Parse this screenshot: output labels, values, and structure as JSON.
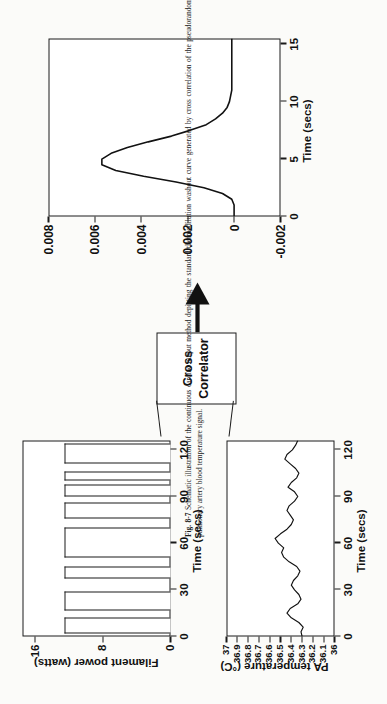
{
  "figure": {
    "label": "Fig. 8-7",
    "caption": "Schematic illustration of the continuous cardiac output method depicting the standard thermodilution washout curve generated by cross correlation of the pseudorandom filament power input sequence with the resulting pulmonary artery blood temperature signal.",
    "rotation_note": "page rotated 90 degrees"
  },
  "washout_plot": {
    "name": "thermodilution-washout-curve",
    "xlabel": "Time (secs)",
    "ylabel": "",
    "xticks": [
      "0",
      "5",
      "10",
      "15"
    ],
    "yticks": [
      "-0.002",
      "0",
      "0.002",
      "0.004",
      "0.006",
      "0.008"
    ]
  },
  "correlator": {
    "line1": "Cross",
    "line2": "Correlator"
  },
  "filament_plot": {
    "name": "filament-power-chart",
    "ylabel": "Filament power (watts)",
    "xlabel": "Time (secs)",
    "xticks": [
      "0",
      "30",
      "60",
      "90",
      "120"
    ],
    "yticks": [
      "0",
      "8",
      "16"
    ]
  },
  "temperature_plot": {
    "name": "pa-temperature-chart",
    "ylabel": "PA temperature (°C)",
    "xlabel": "Time (secs)",
    "xticks": [
      "0",
      "30",
      "60",
      "90",
      "120"
    ],
    "yticks": [
      "36",
      "36.1",
      "36.2",
      "36.3",
      "36.4",
      "36.5",
      "36.6",
      "36.7",
      "36.8",
      "36.9",
      "37"
    ]
  },
  "chart_data": [
    {
      "type": "bar",
      "title": "Filament power (watts) vs Time (secs)",
      "xlabel": "Time (secs)",
      "ylabel": "Filament power (watts)",
      "xlim": [
        0,
        126
      ],
      "ylim": [
        0,
        17.5
      ],
      "xticks": [
        0,
        30,
        60,
        90,
        120
      ],
      "yticks": [
        0,
        8,
        16
      ],
      "grid": false,
      "description": "Pseudorandom binary on/off filament power sequence alternating between 0 and ~12.5 watts",
      "bars": [
        {
          "start": 2,
          "end": 12,
          "value": 12.5
        },
        {
          "start": 17,
          "end": 29,
          "value": 12.5
        },
        {
          "start": 37,
          "end": 45,
          "value": 12.5
        },
        {
          "start": 51,
          "end": 70,
          "value": 12.5
        },
        {
          "start": 76,
          "end": 86,
          "value": 12.5
        },
        {
          "start": 90,
          "end": 98,
          "value": 12.5
        },
        {
          "start": 100,
          "end": 106,
          "value": 12.5
        },
        {
          "start": 111,
          "end": 124,
          "value": 12.5
        }
      ]
    },
    {
      "type": "line",
      "title": "PA temperature (°C) vs Time (secs)",
      "xlabel": "Time (secs)",
      "ylabel": "PA temperature (°C)",
      "xlim": [
        0,
        126
      ],
      "ylim": [
        36,
        37
      ],
      "xticks": [
        0,
        30,
        60,
        90,
        120
      ],
      "yticks": [
        36,
        36.1,
        36.2,
        36.3,
        36.4,
        36.5,
        36.6,
        36.7,
        36.8,
        36.9,
        37
      ],
      "grid": false,
      "description": "Noisy pulmonary artery blood temperature fluctuating about 36.3-36.5 C",
      "x": [
        0,
        3,
        6,
        9,
        12,
        15,
        18,
        21,
        24,
        27,
        30,
        33,
        36,
        39,
        42,
        45,
        48,
        51,
        54,
        57,
        60,
        63,
        66,
        69,
        72,
        75,
        78,
        81,
        84,
        87,
        90,
        93,
        96,
        99,
        102,
        105,
        108,
        111,
        114,
        117,
        120,
        123,
        126
      ],
      "y": [
        36.3,
        36.31,
        36.29,
        36.33,
        36.4,
        36.44,
        36.41,
        36.34,
        36.31,
        36.33,
        36.37,
        36.4,
        36.38,
        36.34,
        36.32,
        36.35,
        36.42,
        36.47,
        36.49,
        36.47,
        36.52,
        36.55,
        36.5,
        36.44,
        36.4,
        36.38,
        36.41,
        36.44,
        36.42,
        36.37,
        36.34,
        36.37,
        36.43,
        36.4,
        36.35,
        36.33,
        36.36,
        36.41,
        36.46,
        36.44,
        36.39,
        36.36,
        36.34
      ]
    },
    {
      "type": "line",
      "title": "Thermodilution washout curve",
      "xlabel": "Time (secs)",
      "ylabel": "",
      "xlim": [
        0,
        15.5
      ],
      "ylim": [
        -0.002,
        0.008
      ],
      "xticks": [
        0,
        5,
        10,
        15
      ],
      "yticks": [
        -0.002,
        0,
        0.002,
        0.004,
        0.006,
        0.008
      ],
      "grid": false,
      "description": "Cross-correlation output: washout curve peaking near 0.0057 at t = 5 s then decaying to baseline",
      "x": [
        0,
        0.5,
        1,
        1.5,
        2,
        2.5,
        3,
        3.5,
        4,
        4.5,
        5,
        5.5,
        6,
        6.5,
        7,
        7.5,
        8,
        8.5,
        9,
        9.5,
        10,
        11,
        12,
        13,
        14,
        15,
        15.5
      ],
      "y": [
        0.0,
        0.0,
        0.0,
        0.0001,
        0.0005,
        0.0013,
        0.0025,
        0.0039,
        0.0051,
        0.0057,
        0.0057,
        0.0053,
        0.0046,
        0.0037,
        0.0027,
        0.0019,
        0.0012,
        0.0008,
        0.0005,
        0.0003,
        0.0002,
        0.0001,
        0.0001,
        0.0001,
        0.0001,
        0.0001,
        0.0001
      ]
    }
  ]
}
